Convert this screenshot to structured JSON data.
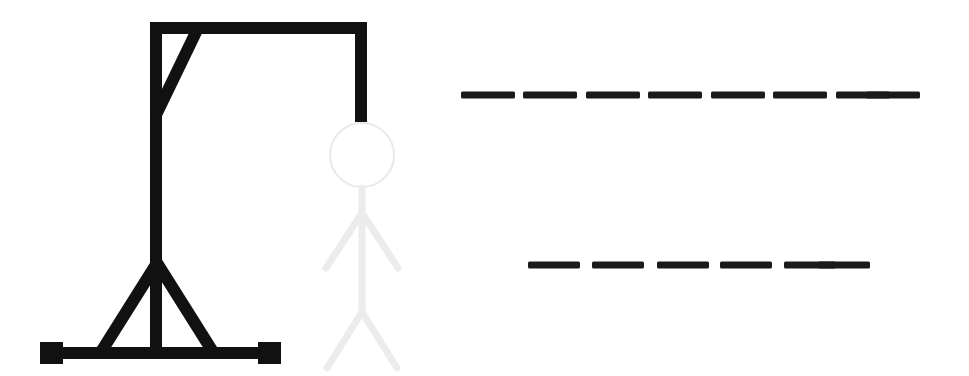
{
  "game": {
    "name": "Hangman",
    "background_color": "#ffffff",
    "ink_color": "#111111",
    "figure_color": "#eeeeee",
    "head_color": "#e8e8e8"
  },
  "gallows": {
    "label": "gallows",
    "color": "#111111",
    "parts": [
      {
        "name": "base-bar",
        "x": 40,
        "y": 347,
        "w": 241,
        "h": 12
      },
      {
        "name": "left-foot-block",
        "x": 40,
        "y": 342,
        "w": 23,
        "h": 22
      },
      {
        "name": "right-foot-block",
        "x": 258,
        "y": 342,
        "w": 23,
        "h": 22
      },
      {
        "name": "vertical-post",
        "x": 150,
        "y": 22,
        "w": 12,
        "h": 330
      },
      {
        "name": "top-beam",
        "x": 150,
        "y": 22,
        "w": 217,
        "h": 12
      },
      {
        "name": "rope",
        "x": 355,
        "y": 22,
        "w": 12,
        "h": 100
      }
    ],
    "braces": [
      {
        "name": "top-diagonal-brace",
        "x1": 156,
        "y1": 115,
        "x2": 198,
        "y2": 28,
        "width": 12
      },
      {
        "name": "base-left-brace",
        "x1": 157,
        "y1": 263,
        "x2": 101,
        "y2": 352,
        "width": 12
      },
      {
        "name": "base-right-brace",
        "x1": 157,
        "y1": 263,
        "x2": 213,
        "y2": 352,
        "width": 12
      }
    ]
  },
  "figure": {
    "label": "hanged-man-figure",
    "state": "drawn-faint",
    "head": {
      "cx": 362,
      "cy": 155,
      "r": 32,
      "stroke_width": 2,
      "color": "#e9e9e9"
    },
    "body_color": "#ececec",
    "body_stroke_width": 7,
    "limbs": [
      {
        "name": "torso",
        "x1": 362,
        "y1": 188,
        "x2": 362,
        "y2": 312
      },
      {
        "name": "left-arm",
        "x1": 362,
        "y1": 213,
        "x2": 326,
        "y2": 268
      },
      {
        "name": "right-arm",
        "x1": 362,
        "y1": 213,
        "x2": 398,
        "y2": 268
      },
      {
        "name": "left-leg",
        "x1": 362,
        "y1": 312,
        "x2": 327,
        "y2": 368
      },
      {
        "name": "right-leg",
        "x1": 362,
        "y1": 312,
        "x2": 397,
        "y2": 368
      }
    ]
  },
  "word_area": {
    "label": "word-blanks",
    "color": "#1a1a1a",
    "dash_height": 7,
    "lines": [
      {
        "name": "word-line-1",
        "y": 95,
        "letter_count": 8,
        "letters": [
          "",
          "",
          "",
          "",
          "",
          "",
          "",
          ""
        ],
        "dashes": [
          {
            "x": 461,
            "w": 54
          },
          {
            "x": 523,
            "w": 54
          },
          {
            "x": 586,
            "w": 54
          },
          {
            "x": 648,
            "w": 54
          },
          {
            "x": 711,
            "w": 54
          },
          {
            "x": 773,
            "w": 54
          },
          {
            "x": 836,
            "w": 54
          },
          {
            "x": 866,
            "w": 54
          }
        ]
      },
      {
        "name": "word-line-2",
        "y": 265,
        "letter_count": 6,
        "letters": [
          "",
          "",
          "",
          "",
          "",
          ""
        ],
        "dashes": [
          {
            "x": 528,
            "w": 52
          },
          {
            "x": 592,
            "w": 52
          },
          {
            "x": 657,
            "w": 52
          },
          {
            "x": 720,
            "w": 52
          },
          {
            "x": 784,
            "w": 52
          },
          {
            "x": 818,
            "w": 52
          }
        ]
      }
    ]
  },
  "status": {
    "guessed_letters": [],
    "wrong_guesses": 0
  }
}
